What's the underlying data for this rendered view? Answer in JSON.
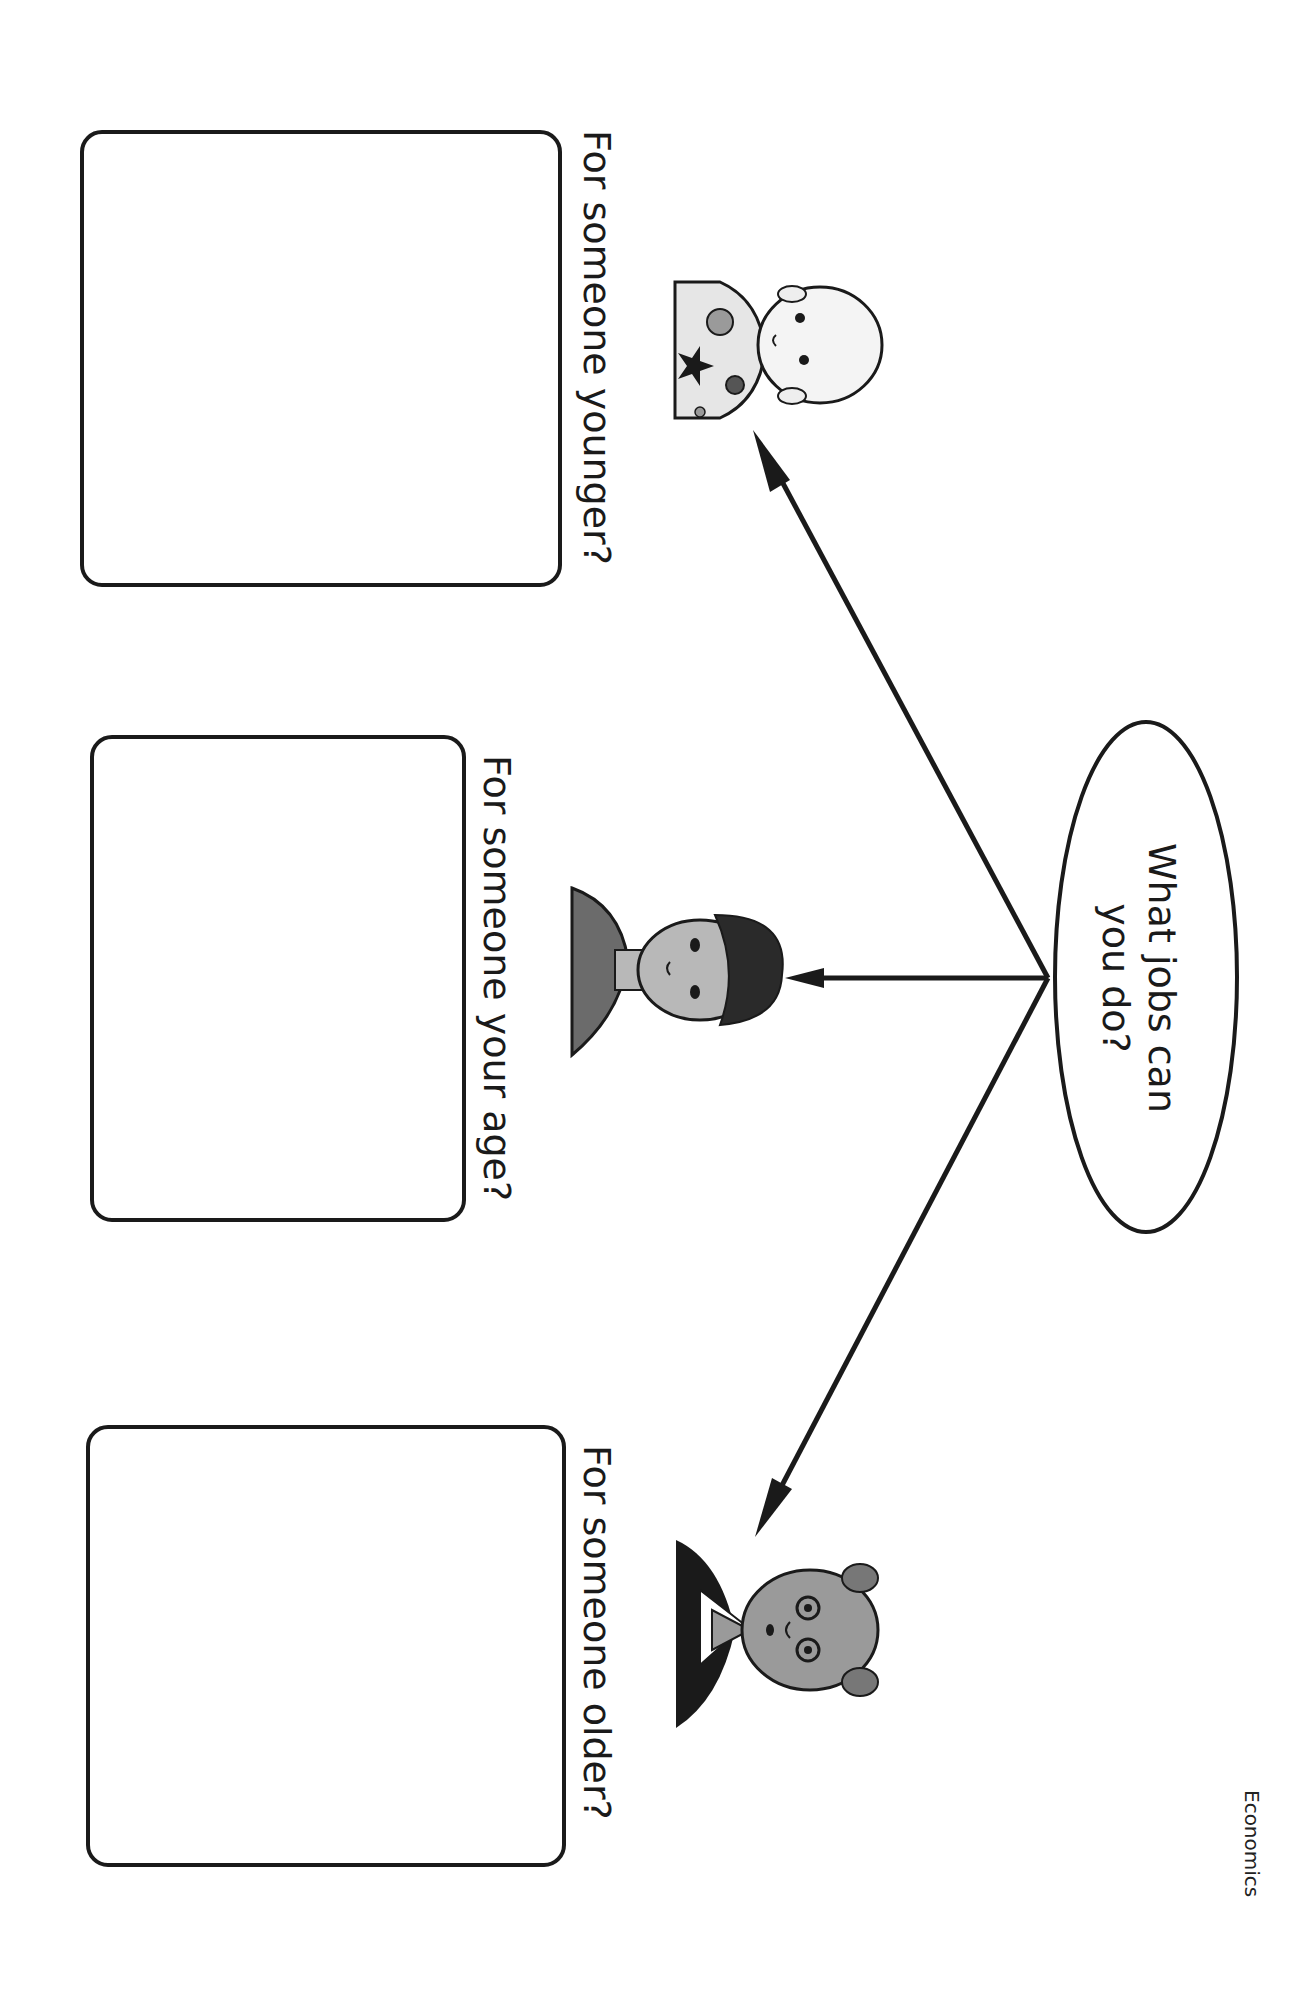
{
  "worksheet": {
    "subject": "Economics",
    "central_question": {
      "line1": "What jobs can",
      "line2": "you do?"
    },
    "sections": [
      {
        "id": "younger",
        "label": "For someone younger?",
        "figure": "baby"
      },
      {
        "id": "same-age",
        "label": "For someone your age?",
        "figure": "child"
      },
      {
        "id": "older",
        "label": "For someone older?",
        "figure": "elderly-man"
      }
    ],
    "answer_boxes": [
      {
        "id": "younger",
        "value": ""
      },
      {
        "id": "same-age",
        "value": ""
      },
      {
        "id": "older",
        "value": ""
      }
    ]
  },
  "colors": {
    "ink": "#1a1a1a",
    "light_gray": "#e6e6e6",
    "mid_gray": "#9a9a9a",
    "dark_gray": "#555555"
  }
}
